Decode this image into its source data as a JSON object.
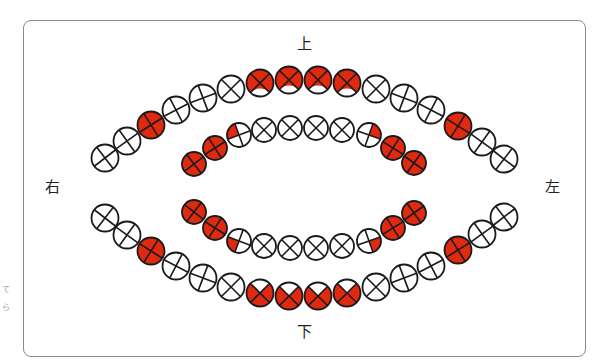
{
  "labels": {
    "top": "上",
    "bottom": "下",
    "left_side": "右",
    "right_side": "左"
  },
  "margin_marks": [
    "て",
    "ら"
  ],
  "colors": {
    "fill_red": "#e02a10",
    "stroke": "#1a1a1a",
    "frame": "#8a8a8a"
  },
  "legend_semantics": {
    "full": "fully red circle",
    "empty": "empty circle",
    "top3": "red on top three quadrants (X divider)",
    "bottom3": "red on bottom three quadrants (X divider)",
    "tl": "top-left quarter red",
    "tr": "top-right quarter red",
    "bl": "bottom-left quarter red",
    "br": "bottom-right quarter red"
  },
  "arcs": [
    {
      "name": "outer-upper-arc",
      "circles": [
        {
          "x": 105,
          "y": 158,
          "fill": "empty",
          "cross": "plus"
        },
        {
          "x": 127,
          "y": 141,
          "fill": "empty",
          "cross": "plus"
        },
        {
          "x": 151,
          "y": 125,
          "fill": "full",
          "cross": "plus"
        },
        {
          "x": 176,
          "y": 110,
          "fill": "empty",
          "cross": "plus"
        },
        {
          "x": 203,
          "y": 98,
          "fill": "empty",
          "cross": "plus"
        },
        {
          "x": 231,
          "y": 89,
          "fill": "empty",
          "cross": "x"
        },
        {
          "x": 260,
          "y": 83,
          "fill": "top3",
          "cross": "x"
        },
        {
          "x": 289,
          "y": 80,
          "fill": "top3",
          "cross": "x"
        },
        {
          "x": 318,
          "y": 80,
          "fill": "top3",
          "cross": "x"
        },
        {
          "x": 347,
          "y": 83,
          "fill": "top3",
          "cross": "x"
        },
        {
          "x": 376,
          "y": 89,
          "fill": "empty",
          "cross": "x"
        },
        {
          "x": 404,
          "y": 98,
          "fill": "empty",
          "cross": "plus"
        },
        {
          "x": 431,
          "y": 110,
          "fill": "empty",
          "cross": "plus"
        },
        {
          "x": 458,
          "y": 126,
          "fill": "full",
          "cross": "plus"
        },
        {
          "x": 482,
          "y": 142,
          "fill": "empty",
          "cross": "plus"
        },
        {
          "x": 504,
          "y": 159,
          "fill": "empty",
          "cross": "plus"
        }
      ]
    },
    {
      "name": "inner-upper-arc",
      "circles": [
        {
          "x": 194,
          "y": 164,
          "fill": "full",
          "cross": "plus"
        },
        {
          "x": 215,
          "y": 148,
          "fill": "full",
          "cross": "plus"
        },
        {
          "x": 239,
          "y": 135,
          "fill": "tl",
          "cross": "plus"
        },
        {
          "x": 264,
          "y": 130,
          "fill": "empty",
          "cross": "x"
        },
        {
          "x": 290,
          "y": 128,
          "fill": "empty",
          "cross": "x"
        },
        {
          "x": 316,
          "y": 128,
          "fill": "empty",
          "cross": "x"
        },
        {
          "x": 342,
          "y": 130,
          "fill": "empty",
          "cross": "x"
        },
        {
          "x": 369,
          "y": 135,
          "fill": "tr",
          "cross": "plus"
        },
        {
          "x": 393,
          "y": 148,
          "fill": "full",
          "cross": "plus"
        },
        {
          "x": 414,
          "y": 163,
          "fill": "full",
          "cross": "plus"
        }
      ]
    },
    {
      "name": "inner-lower-arc",
      "circles": [
        {
          "x": 194,
          "y": 212,
          "fill": "full",
          "cross": "plus"
        },
        {
          "x": 215,
          "y": 228,
          "fill": "full",
          "cross": "plus"
        },
        {
          "x": 239,
          "y": 241,
          "fill": "bl",
          "cross": "plus"
        },
        {
          "x": 264,
          "y": 246,
          "fill": "empty",
          "cross": "x"
        },
        {
          "x": 290,
          "y": 248,
          "fill": "empty",
          "cross": "x"
        },
        {
          "x": 316,
          "y": 248,
          "fill": "empty",
          "cross": "x"
        },
        {
          "x": 342,
          "y": 246,
          "fill": "empty",
          "cross": "x"
        },
        {
          "x": 369,
          "y": 241,
          "fill": "br",
          "cross": "plus"
        },
        {
          "x": 393,
          "y": 228,
          "fill": "full",
          "cross": "plus"
        },
        {
          "x": 414,
          "y": 213,
          "fill": "full",
          "cross": "plus"
        }
      ]
    },
    {
      "name": "outer-lower-arc",
      "circles": [
        {
          "x": 105,
          "y": 218,
          "fill": "empty",
          "cross": "plus"
        },
        {
          "x": 127,
          "y": 235,
          "fill": "empty",
          "cross": "plus"
        },
        {
          "x": 151,
          "y": 251,
          "fill": "full",
          "cross": "plus"
        },
        {
          "x": 176,
          "y": 266,
          "fill": "empty",
          "cross": "plus"
        },
        {
          "x": 203,
          "y": 278,
          "fill": "empty",
          "cross": "plus"
        },
        {
          "x": 231,
          "y": 287,
          "fill": "empty",
          "cross": "x"
        },
        {
          "x": 260,
          "y": 293,
          "fill": "bottom3",
          "cross": "x"
        },
        {
          "x": 289,
          "y": 296,
          "fill": "bottom3",
          "cross": "x"
        },
        {
          "x": 318,
          "y": 296,
          "fill": "bottom3",
          "cross": "x"
        },
        {
          "x": 347,
          "y": 293,
          "fill": "bottom3",
          "cross": "x"
        },
        {
          "x": 376,
          "y": 287,
          "fill": "empty",
          "cross": "x"
        },
        {
          "x": 404,
          "y": 278,
          "fill": "empty",
          "cross": "plus"
        },
        {
          "x": 431,
          "y": 266,
          "fill": "empty",
          "cross": "plus"
        },
        {
          "x": 458,
          "y": 250,
          "fill": "full",
          "cross": "plus"
        },
        {
          "x": 482,
          "y": 234,
          "fill": "empty",
          "cross": "plus"
        },
        {
          "x": 504,
          "y": 217,
          "fill": "empty",
          "cross": "plus"
        }
      ]
    }
  ],
  "radius": {
    "outer": 13.5,
    "inner": 12
  }
}
